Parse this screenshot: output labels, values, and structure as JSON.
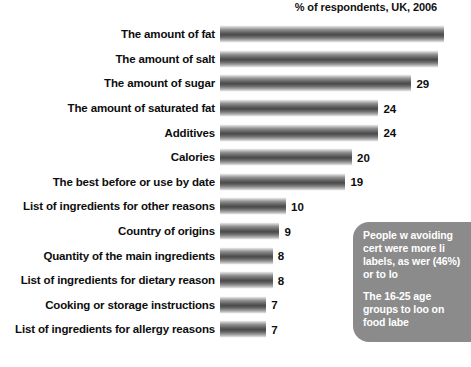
{
  "chart_data": {
    "type": "bar",
    "orientation": "horizontal",
    "title": "% of respondents, UK, 2006",
    "xlabel": "",
    "ylabel": "",
    "xlim": [
      0,
      32
    ],
    "grid": false,
    "legend": null,
    "categories": [
      "The amount of fat",
      "The amount of salt",
      "The amount of sugar",
      "The amount of saturated fat",
      "Additives",
      "Calories",
      "The best before or use by date",
      "List of ingredients for other reasons",
      "Country of origins",
      "Quantity of the main ingredients",
      "List of ingredients for dietary reason",
      "Cooking or storage instructions",
      "List of ingredients for allergy reasons"
    ],
    "values": [
      34,
      33,
      29,
      24,
      24,
      20,
      19,
      10,
      9,
      8,
      8,
      7,
      7
    ],
    "value_labels": [
      "",
      "",
      "29",
      "24",
      "24",
      "20",
      "19",
      "10",
      "9",
      "8",
      "8",
      "7",
      "7"
    ]
  },
  "callout": {
    "paragraph_1": "People w avoiding cert were more li labels, as wer (46%) or to lo",
    "paragraph_2": "The 16-25 age groups to loo on food labe",
    "color": "#8b8b8b",
    "text_color": "#ffffff"
  },
  "style": {
    "bar_color_light": "#c9c9c9",
    "bar_color_dark": "#4a4a4a",
    "text_color": "#0d0d0d",
    "background": "#ffffff"
  }
}
